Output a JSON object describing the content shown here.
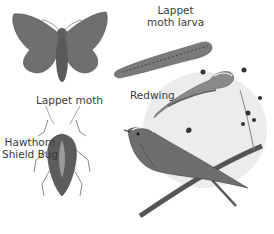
{
  "labels": {
    "lappet_moth": "Lappet moth",
    "lappet_larva_line1": "Lappet",
    "lappet_larva_line2": "moth larva",
    "redwing": "Redwing",
    "shield_bug_line1": "Hawthorn",
    "shield_bug_line2": "Shield Bug"
  },
  "colors": {
    "background": "#ffffff",
    "label_text": "#3a3a3a",
    "illustration_dark": "#4a4a4a",
    "illustration_mid": "#7a7a7a",
    "illustration_light": "#bdbdbd"
  }
}
